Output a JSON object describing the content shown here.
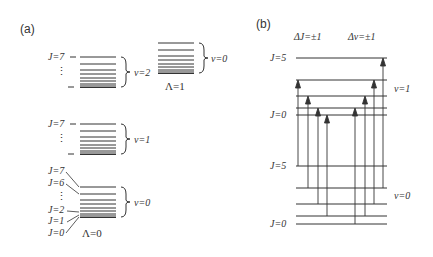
{
  "panel_a": {
    "label": "(a)",
    "states": [
      {
        "name": "Lambda0",
        "label": "Λ=0"
      },
      {
        "name": "Lambda1",
        "label": "Λ=1"
      }
    ],
    "vibrational": {
      "v2": "v=2",
      "v1": "v=1",
      "v0": "v=0",
      "v0_upper": "v=0"
    },
    "j_labels": {
      "j7_v2": "J=7",
      "j7_v1": "J=7",
      "j7": "J=7",
      "j6": "J=6",
      "j2": "J=2",
      "j1": "J=1",
      "j0": "J=0",
      "dots": "⋮"
    }
  },
  "panel_b": {
    "label": "(b)",
    "rules": {
      "delta_j": "ΔJ=±1",
      "delta_v": "Δv=±1"
    },
    "upper": {
      "j5": "J=5",
      "j0": "J=0",
      "v": "v=1"
    },
    "lower": {
      "j5": "J=5",
      "j0": "J=0",
      "v": "v=0"
    }
  }
}
